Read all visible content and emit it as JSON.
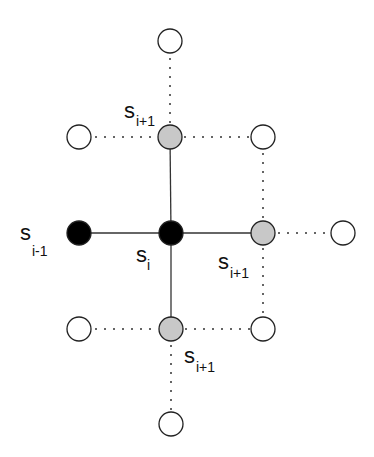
{
  "diagram": {
    "labels": {
      "s_main": "s",
      "sub_i": "i",
      "sub_i_minus_1": "i-1",
      "sub_i_plus_1": "i+1"
    },
    "nodes": [
      {
        "id": "top",
        "x": 170,
        "y": 41,
        "fill": "white"
      },
      {
        "id": "upper-left",
        "x": 79,
        "y": 137,
        "fill": "white"
      },
      {
        "id": "upper-mid",
        "x": 170,
        "y": 137,
        "fill": "gray"
      },
      {
        "id": "upper-right",
        "x": 263,
        "y": 137,
        "fill": "white"
      },
      {
        "id": "s-i-minus-1",
        "x": 79,
        "y": 233,
        "fill": "black"
      },
      {
        "id": "s-i",
        "x": 171,
        "y": 233,
        "fill": "black"
      },
      {
        "id": "mid-right",
        "x": 263,
        "y": 233,
        "fill": "gray"
      },
      {
        "id": "far-right",
        "x": 343,
        "y": 233,
        "fill": "white"
      },
      {
        "id": "lower-left",
        "x": 79,
        "y": 329,
        "fill": "white"
      },
      {
        "id": "lower-mid",
        "x": 171,
        "y": 329,
        "fill": "gray"
      },
      {
        "id": "lower-right",
        "x": 263,
        "y": 329,
        "fill": "white"
      },
      {
        "id": "bottom",
        "x": 171,
        "y": 424,
        "fill": "white"
      }
    ],
    "colors": {
      "black_node": "#000000",
      "gray_node": "#c8c8c8",
      "white_node": "#ffffff",
      "stroke": "#222222"
    }
  }
}
